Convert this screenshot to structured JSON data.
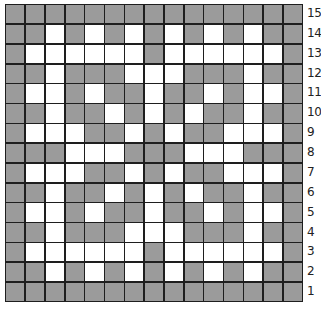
{
  "chart_data": {
    "type": "heatmap",
    "title": "",
    "grid_size": [
      15,
      15
    ],
    "legend": {
      "G": "shaded (gray)",
      "W": "unshaded (white)"
    },
    "colors": {
      "shaded": "#9b9b9b",
      "unshaded": "#ffffff",
      "grid_line": "#1e1e1e"
    },
    "row_labels": [
      "15",
      "14",
      "13",
      "12",
      "11",
      "10",
      "9",
      "8",
      "7",
      "6",
      "5",
      "4",
      "3",
      "2",
      "1"
    ],
    "rows": [
      "GGGGGGGGGGGGGGG",
      "GGWGWGWGWGWGWGG",
      "GWWWWWWGWWWWWWG",
      "GGWGGGWWWGGGWGG",
      "GWWGWGGWGGWGWWG",
      "GGWGGWGWGWGGWGG",
      "GWWWGGWGWGGWWWG",
      "GGGWWWGGGWWWGGG",
      "GWWWGGWGWGGWWWG",
      "GGWGGWGWGWGGWGG",
      "GWWGWGGWGGWGWWG",
      "GGWGGGWWWGGGWGG",
      "GWWWWWWGWWWWWWG",
      "GGWGWGWGWGWGWGG",
      "GGGGGGGGGGGGGGG"
    ]
  }
}
